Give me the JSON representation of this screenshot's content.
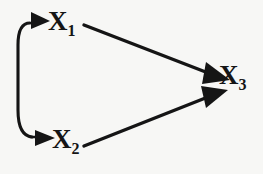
{
  "figure": {
    "kind": "causal-path-diagram",
    "background_color": "#f7f7f5",
    "ink_color": "#151515",
    "width": 263,
    "height": 174
  },
  "nodes": [
    {
      "id": "x1",
      "base": "X",
      "subscript": "1",
      "label": "X1",
      "x": 48,
      "y": 8
    },
    {
      "id": "x2",
      "base": "X",
      "subscript": "2",
      "label": "X2",
      "x": 52,
      "y": 126
    },
    {
      "id": "x3",
      "base": "X",
      "subscript": "3",
      "label": "X3",
      "x": 219,
      "y": 62
    }
  ],
  "edges": [
    {
      "id": "x1-to-x3",
      "from": "X1",
      "to": "X3",
      "style": "straight",
      "arrowheads": "to",
      "description": "straight arrow from X1 to X3"
    },
    {
      "id": "x2-to-x3",
      "from": "X2",
      "to": "X3",
      "style": "straight",
      "arrowheads": "to",
      "description": "straight arrow from X2 to X3"
    },
    {
      "id": "x1-x2-curved",
      "from": "X2",
      "to": "X1",
      "style": "curved-left",
      "arrowheads": "both",
      "description": "curved double-headed arrow on the left linking X1 and X2"
    }
  ]
}
